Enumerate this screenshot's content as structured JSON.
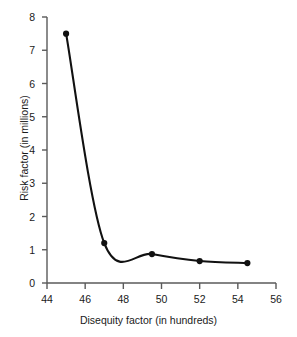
{
  "chart_data": {
    "type": "line",
    "title": "",
    "xlabel": "Disequity factor (in hundreds)",
    "ylabel": "Risk factor (in millions)",
    "xlim": [
      44,
      56
    ],
    "ylim": [
      0,
      8
    ],
    "xticks": [
      "44",
      "46",
      "48",
      "50",
      "52",
      "54",
      "56"
    ],
    "yticks": [
      "0",
      "1",
      "2",
      "3",
      "4",
      "5",
      "6",
      "7",
      "8"
    ],
    "grid": false,
    "legend": null,
    "marker": "filled-circle",
    "line_color": "#111111",
    "marker_color": "#111111",
    "background_color": "#ffffff",
    "series": [
      {
        "name": "Risk factor",
        "x": [
          45.0,
          47.0,
          49.5,
          52.0,
          54.5
        ],
        "values": [
          7.5,
          1.2,
          0.87,
          0.66,
          0.6
        ]
      }
    ]
  },
  "axis": {
    "x_title": "Disequity factor (in hundreds)",
    "y_title": "Risk factor (in millions)"
  }
}
